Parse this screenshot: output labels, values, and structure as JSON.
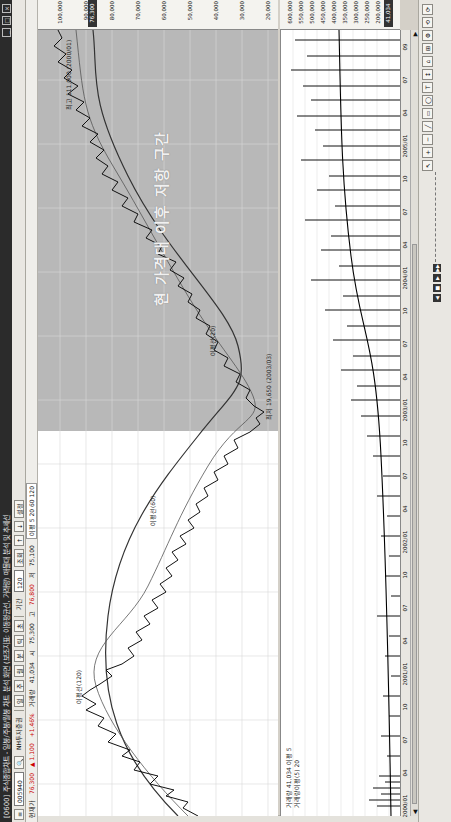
{
  "window": {
    "title": "[0600] 주식종합차트 - 일봉/주봉/월봉 차트 분석 화면 (보조지표: 이동평균선, 거래량) 매물대 분석 및 추세선",
    "controls": [
      "최소화",
      "최대화",
      "닫기"
    ]
  },
  "toolbar": {
    "stock_code": "005940",
    "stock_name": "NH투자증권",
    "buttons": [
      "일",
      "주",
      "월",
      "분",
      "틱",
      "초"
    ],
    "period_value": "120",
    "unit_label": "기간",
    "apply_label": "조회",
    "extra_buttons": [
      "↑",
      "↓",
      "설정"
    ]
  },
  "infobar": {
    "price_label": "현재가",
    "price": "76,300",
    "change": "▲ 1,100",
    "change_pct": "+1.46%",
    "volume_label": "거래량",
    "volume": "41,034",
    "open_label": "시",
    "open": "75,300",
    "high_label": "고",
    "high": "76,800",
    "low_label": "저",
    "low": "75,100",
    "ma_chip": "이평 5 20 60 120"
  },
  "chart": {
    "price_axis": [
      "100,000",
      "90,000",
      "80,000",
      "70,000",
      "60,000",
      "50,000",
      "40,000",
      "30,000",
      "20,000"
    ],
    "current_price_tag": "76,300",
    "volume_axis": [
      "600,000",
      "550,000",
      "500,000",
      "450,000",
      "400,000",
      "350,000",
      "300,000",
      "250,000",
      "200,000",
      "150,000"
    ],
    "volume_tag": "41,034",
    "date_axis": [
      "2000/01",
      "04",
      "07",
      "10",
      "2001/01",
      "04",
      "07",
      "10",
      "2002/01",
      "04",
      "07",
      "10",
      "2003/01",
      "04",
      "07",
      "10",
      "2004/01",
      "04",
      "07",
      "10",
      "2005/01",
      "04",
      "07",
      "09"
    ],
    "annotations": {
      "resistance_zone": "현 가격대 이후 저항 구간",
      "peak": "최고 111,000 (2000/01)",
      "low": "최저 19,650 (2003/03)",
      "ma_label_1": "이평선(120)",
      "ma_label_2": "이평선(60)",
      "ma_label_3": "이평선(20)"
    },
    "volume_info": "거래량 41,034  이평 5",
    "volume_ma_info": "거래량이평(5) 20"
  },
  "bottombar": {
    "tools": [
      "↖",
      "+",
      "─",
      "╱",
      "▭",
      "◯",
      "T",
      "↕",
      "⌂",
      "⊞",
      "⚙",
      "⟲",
      "⟳"
    ],
    "play": [
      "◀",
      "■",
      "▶",
      "▶▶"
    ]
  },
  "colors": {
    "titlebar": "#2b2b2b",
    "shaded_zone": "#b8b8b8",
    "price_line": "#222222",
    "ma_line": "#333333",
    "up": "#cc0000"
  }
}
